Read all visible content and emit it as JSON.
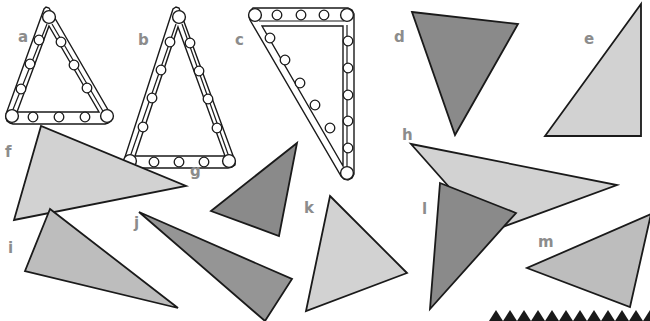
{
  "figure": {
    "width": 650,
    "height": 321,
    "background_color": "#ffffff",
    "label_color": "#8c8c8c",
    "outline_color": "#1a1a1a",
    "fill_light": "#d2d2d2",
    "fill_medium": "#bdbdbd",
    "fill_dark": "#8a8a8a",
    "fill_white": "#ffffff"
  },
  "shapes": [
    {
      "label": "a",
      "label_x": 18,
      "label_y": 42,
      "kind": "perforated-triangle-outline",
      "fill": "#ffffff",
      "description": "equilateral triangular strip frame with round holes"
    },
    {
      "label": "b",
      "label_x": 138,
      "label_y": 45,
      "kind": "perforated-triangle-outline",
      "fill": "#ffffff",
      "description": "tall isosceles triangular strip frame with round holes"
    },
    {
      "label": "c",
      "label_x": 235,
      "label_y": 45,
      "kind": "perforated-triangle-outline",
      "fill": "#ffffff",
      "description": "right triangular strip frame with round holes"
    },
    {
      "label": "d",
      "label_x": 394,
      "label_y": 42,
      "kind": "solid-triangle",
      "fill": "#8a8a8a",
      "points": "412,12 518,24 455,135"
    },
    {
      "label": "e",
      "label_x": 584,
      "label_y": 44,
      "kind": "solid-triangle",
      "fill": "#d2d2d2",
      "points": "640,4 640,136 545,136"
    },
    {
      "label": "f",
      "label_x": 5,
      "label_y": 157,
      "kind": "solid-triangle",
      "fill": "#d2d2d2",
      "points": "41,126 14,220 186,186"
    },
    {
      "label": "g",
      "label_x": 190,
      "label_y": 176,
      "kind": "solid-triangle",
      "fill": "#8a8a8a",
      "points": "297,143 211,211 279,236"
    },
    {
      "label": "h",
      "label_x": 402,
      "label_y": 140,
      "kind": "solid-triangle",
      "fill": "#d2d2d2",
      "points": "411,144 617,185 489,232"
    },
    {
      "label": "i",
      "label_x": 8,
      "label_y": 253,
      "kind": "solid-triangle",
      "fill": "#bdbdbd",
      "points": "50,209 25,271 178,308"
    },
    {
      "label": "j",
      "label_x": 134,
      "label_y": 228,
      "kind": "solid-triangle",
      "fill": "#959595",
      "points": "139,212 292,279 265,321"
    },
    {
      "label": "k",
      "label_x": 304,
      "label_y": 213,
      "kind": "solid-triangle",
      "fill": "#d2d2d2",
      "points": "330,196 407,273 306,311"
    },
    {
      "label": "l",
      "label_x": 422,
      "label_y": 214,
      "kind": "solid-triangle",
      "fill": "#8a8a8a",
      "points": "440,183 516,213 430,309"
    },
    {
      "label": "m",
      "label_x": 538,
      "label_y": 247,
      "kind": "solid-triangle",
      "fill": "#bdbdbd",
      "points": "650,214 630,307 527,268"
    }
  ],
  "bottom_strip": {
    "name": "row of small dark triangles cropped at bottom edge",
    "count": 12,
    "fill": "#1a1a1a",
    "start_x": 489,
    "spacing": 14,
    "y": 310
  }
}
